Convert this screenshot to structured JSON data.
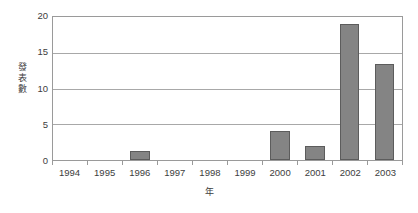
{
  "chart_data": {
    "type": "bar",
    "title": "",
    "subtitle": "",
    "xlabel": "年",
    "ylabel": "發表數",
    "categories": [
      "1994",
      "1995",
      "1996",
      "1997",
      "1998",
      "1999",
      "2000",
      "2001",
      "2002",
      "2003"
    ],
    "values": [
      0,
      0,
      1.3,
      0,
      0,
      0,
      4,
      2,
      19,
      13.4
    ],
    "series": [
      {
        "name": "發表數",
        "values": [
          0,
          0,
          1.3,
          0,
          0,
          0,
          4,
          2,
          19,
          13.4
        ]
      }
    ],
    "ylim": [
      0,
      20
    ],
    "yticks": [
      0,
      5,
      10,
      15,
      20
    ],
    "ytick_labels": [
      "0",
      "5",
      "10",
      "15",
      "20"
    ],
    "grid": true,
    "grid_axis": "y",
    "legend": false,
    "legend_position": "none",
    "bar_color": "#848484",
    "bar_border_color": "#5c5c5c",
    "grid_color": "#a8a8a8",
    "axis_color": "#9a9a9a",
    "text_color": "#3d3d3d",
    "background_color": "#ffffff"
  }
}
